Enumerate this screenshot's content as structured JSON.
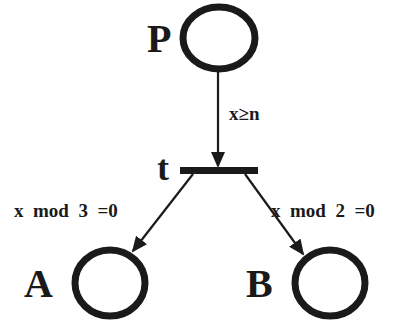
{
  "diagram": {
    "type": "petri-net",
    "places": [
      {
        "id": "P",
        "label": "P"
      },
      {
        "id": "A",
        "label": "A"
      },
      {
        "id": "B",
        "label": "B"
      }
    ],
    "transitions": [
      {
        "id": "t",
        "label": "t"
      }
    ],
    "arcs": [
      {
        "from": "P",
        "to": "t",
        "label": "x≥n"
      },
      {
        "from": "t",
        "to": "A",
        "label": "x  mod  3  =0"
      },
      {
        "from": "t",
        "to": "B",
        "label": "x  mod  2  =0"
      }
    ]
  },
  "colors": {
    "ink": "#1a1a1a",
    "background": "#ffffff"
  }
}
